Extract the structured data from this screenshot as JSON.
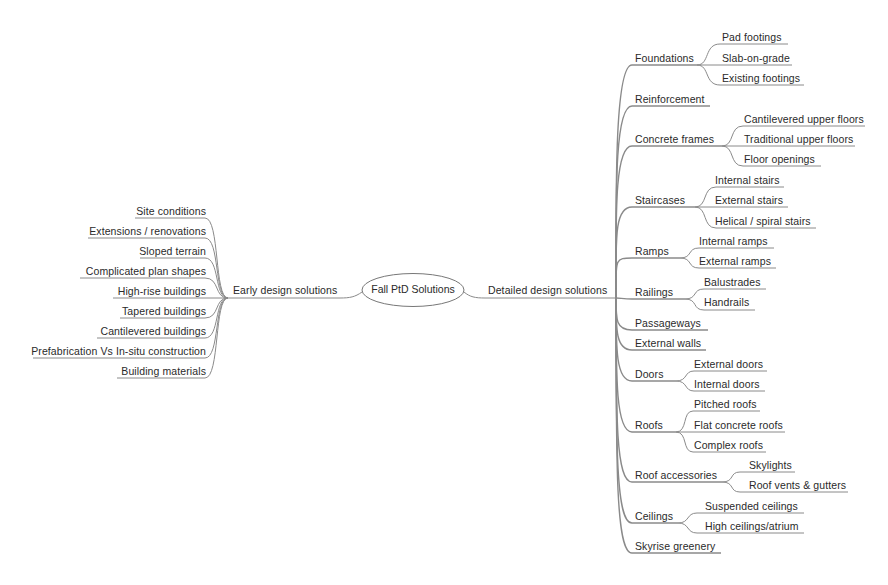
{
  "mindmap": {
    "center": {
      "label": "Fall PtD Solutions"
    },
    "left_branch": {
      "label": "Early design solutions",
      "children": [
        {
          "label": "Site conditions"
        },
        {
          "label": "Extensions / renovations"
        },
        {
          "label": "Sloped terrain"
        },
        {
          "label": "Complicated plan shapes"
        },
        {
          "label": "High-rise buildings"
        },
        {
          "label": "Tapered buildings"
        },
        {
          "label": "Cantilevered buildings"
        },
        {
          "label": "Prefabrication Vs In-situ construction"
        },
        {
          "label": "Building materials"
        }
      ]
    },
    "right_branch": {
      "label": "Detailed design solutions",
      "children": [
        {
          "label": "Foundations",
          "children": [
            {
              "label": "Pad footings"
            },
            {
              "label": "Slab-on-grade"
            },
            {
              "label": "Existing footings"
            }
          ]
        },
        {
          "label": "Reinforcement",
          "children": []
        },
        {
          "label": "Concrete frames",
          "children": [
            {
              "label": "Cantilevered upper floors"
            },
            {
              "label": "Traditional upper floors"
            },
            {
              "label": "Floor openings"
            }
          ]
        },
        {
          "label": "Staircases",
          "children": [
            {
              "label": "Internal stairs"
            },
            {
              "label": "External stairs"
            },
            {
              "label": "Helical / spiral stairs"
            }
          ]
        },
        {
          "label": "Ramps",
          "children": [
            {
              "label": "Internal ramps"
            },
            {
              "label": "External ramps"
            }
          ]
        },
        {
          "label": "Railings",
          "children": [
            {
              "label": "Balustrades"
            },
            {
              "label": "Handrails"
            }
          ]
        },
        {
          "label": "Passageways",
          "children": []
        },
        {
          "label": "External walls",
          "children": []
        },
        {
          "label": "Doors",
          "children": [
            {
              "label": "External doors"
            },
            {
              "label": "Internal doors"
            }
          ]
        },
        {
          "label": "Roofs",
          "children": [
            {
              "label": "Pitched roofs"
            },
            {
              "label": "Flat concrete roofs"
            },
            {
              "label": "Complex roofs"
            }
          ]
        },
        {
          "label": "Roof accessories",
          "children": [
            {
              "label": "Skylights"
            },
            {
              "label": "Roof vents & gutters"
            }
          ]
        },
        {
          "label": "Ceilings",
          "children": [
            {
              "label": "Suspended ceilings"
            },
            {
              "label": "High ceilings/atrium"
            }
          ]
        },
        {
          "label": "Skyrise greenery",
          "children": []
        }
      ]
    }
  },
  "colors": {
    "line": "#8a8a8a",
    "text": "#2a2a2a",
    "background": "#ffffff"
  }
}
